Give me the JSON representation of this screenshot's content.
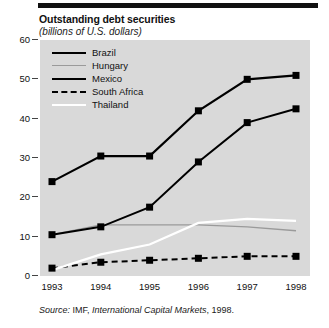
{
  "figure": {
    "title": "Outstanding debt securities",
    "subtitle": "(billions of U.S. dollars)",
    "source_lead": "Source:",
    "source_org": " IMF, ",
    "source_pub": "International Capital Markets",
    "source_year": ", 1998."
  },
  "chart_data": {
    "type": "line",
    "title": "Outstanding debt securities",
    "subtitle": "(billions of U.S. dollars)",
    "xlabel": "",
    "ylabel": "billions of U.S. dollars",
    "x": [
      "1993",
      "1994",
      "1995",
      "1996",
      "1997",
      "1998"
    ],
    "categories": [
      "1993",
      "1994",
      "1995",
      "1996",
      "1997",
      "1998"
    ],
    "ylim": [
      0,
      60
    ],
    "yticks": [
      0,
      10,
      20,
      30,
      40,
      50,
      60
    ],
    "grid": false,
    "legend_position": "top-left-inside",
    "markers": "filled-square",
    "series": [
      {
        "name": "Brazil",
        "color": "#000000",
        "style": "solid",
        "width": 2.2,
        "marker": true,
        "values": [
          24.0,
          30.5,
          30.5,
          42.0,
          50.0,
          51.0
        ]
      },
      {
        "name": "Hungary",
        "color": "#9a9a9a",
        "style": "solid",
        "width": 1.3,
        "marker": false,
        "values": [
          10.5,
          13.0,
          13.0,
          13.0,
          12.5,
          11.5
        ]
      },
      {
        "name": "Mexico",
        "color": "#000000",
        "style": "solid",
        "width": 2.0,
        "marker": true,
        "values": [
          10.5,
          12.5,
          17.5,
          29.0,
          39.0,
          42.5
        ]
      },
      {
        "name": "South Africa",
        "color": "#000000",
        "style": "dashed",
        "width": 2.0,
        "marker": true,
        "values": [
          2.0,
          3.5,
          4.0,
          4.5,
          5.0,
          5.0
        ]
      },
      {
        "name": "Thailand",
        "color": "#ffffff",
        "style": "solid",
        "width": 2.2,
        "marker": false,
        "values": [
          1.5,
          5.5,
          8.0,
          13.5,
          14.5,
          14.0
        ]
      }
    ]
  },
  "axes": {
    "y_tick_labels": [
      "60",
      "50",
      "40",
      "30",
      "20",
      "10",
      "0"
    ],
    "x_tick_labels": [
      "1993",
      "1994",
      "1995",
      "1996",
      "1997",
      "1998"
    ]
  },
  "legend": {
    "items": [
      {
        "label": "Brazil",
        "swatch": "thick-black-line"
      },
      {
        "label": "Hungary",
        "swatch": "thin-gray-line"
      },
      {
        "label": "Mexico",
        "swatch": "thick-black-line"
      },
      {
        "label": "South Africa",
        "swatch": "dashed-black-line"
      },
      {
        "label": "Thailand",
        "swatch": "white-line"
      }
    ]
  }
}
